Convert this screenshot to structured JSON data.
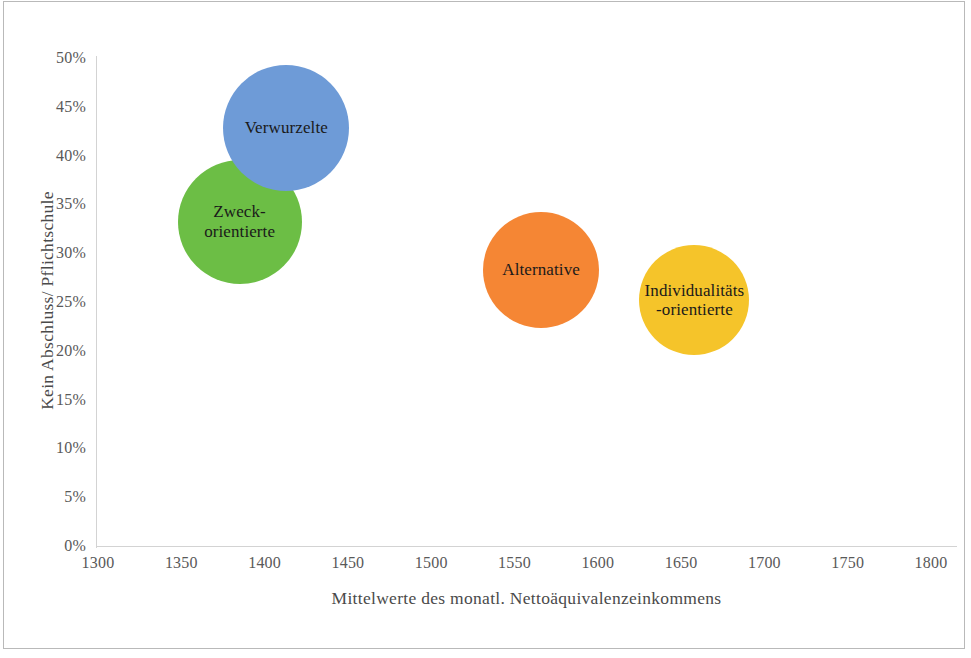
{
  "chart_data": {
    "type": "scatter",
    "title": "",
    "xlabel": "Mittelwerte des monatl. Nettoäquivalenzeinkommens",
    "ylabel": "Kein Abschluss/ Pflichtschule",
    "xlim": [
      1300,
      1800
    ],
    "ylim": [
      0,
      50
    ],
    "xticks": [
      "1300",
      "1350",
      "1400",
      "1450",
      "1500",
      "1550",
      "1600",
      "1650",
      "1700",
      "1750",
      "1800"
    ],
    "xtick_values": [
      1300,
      1350,
      1400,
      1450,
      1500,
      1550,
      1600,
      1650,
      1700,
      1750,
      1800
    ],
    "yticks": [
      "0%",
      "5%",
      "10%",
      "15%",
      "20%",
      "25%",
      "30%",
      "35%",
      "40%",
      "45%",
      "50%"
    ],
    "ytick_values": [
      0,
      5,
      10,
      15,
      20,
      25,
      30,
      35,
      40,
      45,
      50
    ],
    "grid": false,
    "legend": "none",
    "bubbles": [
      {
        "label": "Zweck-\norientierte",
        "x": 1385,
        "y": 33.2,
        "radius_px": 62,
        "color": "#6cbe45",
        "z": 1
      },
      {
        "label": "Verwurzelte",
        "x": 1413,
        "y": 42.8,
        "radius_px": 63,
        "color": "#6e9bd7",
        "z": 2
      },
      {
        "label": "Alternative",
        "x": 1566,
        "y": 28.3,
        "radius_px": 58,
        "color": "#f58634",
        "z": 3
      },
      {
        "label": "Individualitäts\n-orientierte",
        "x": 1658,
        "y": 25.2,
        "radius_px": 55,
        "color": "#f5c42a",
        "z": 4
      }
    ]
  },
  "colors": {
    "axis_line": "#d3d3d3",
    "tick_text": "#595959",
    "title_text": "#4a4a4a",
    "frame": "#b9b9b9",
    "background": "#ffffff"
  }
}
